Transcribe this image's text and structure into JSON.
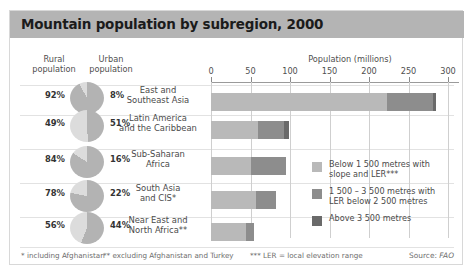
{
  "title": "Mountain population by subregion, 2000",
  "headers": {
    "rural": "Rural\npopulation",
    "rural_line1": "Rural",
    "rural_line2": "population",
    "urban_line1": "Urban",
    "urban_line2": "population",
    "population_axis": "Population (millions)"
  },
  "colors": {
    "title_bar": "#b4b4b4",
    "light": "#b9b9b9",
    "mid": "#8d8d8d",
    "dark": "#6a6a6a",
    "pie_rural": "#b3b3b3",
    "pie_urban": "#dcdcdc",
    "grid": "#cfcfcf",
    "text": "#4a4a4a"
  },
  "axis": {
    "label": "Population (millions)",
    "min": 0,
    "max": 300,
    "ticks": [
      0,
      50,
      100,
      150,
      200,
      250,
      300
    ],
    "tick_labels": [
      "0",
      "50",
      "100",
      "150",
      "200",
      "250",
      "300"
    ]
  },
  "rows": [
    {
      "region_line1": "East and",
      "region_line2": "Southeast Asia",
      "rural_pct": "92%",
      "urban_pct": "8%",
      "rural_value": 92,
      "urban_value": 8,
      "segments": [
        223,
        58,
        4
      ],
      "total": 285
    },
    {
      "region_line1": "Latin America",
      "region_line2": "and the Caribbean",
      "rural_pct": "49%",
      "urban_pct": "51%",
      "rural_value": 49,
      "urban_value": 51,
      "segments": [
        60,
        32,
        7
      ],
      "total": 99
    },
    {
      "region_line1": "Sub-Saharan",
      "region_line2": "Africa",
      "rural_pct": "84%",
      "urban_pct": "16%",
      "rural_value": 84,
      "urban_value": 16,
      "segments": [
        50,
        45,
        0
      ],
      "total": 95
    },
    {
      "region_line1": "South Asia",
      "region_line2": "and CIS*",
      "rural_pct": "78%",
      "urban_pct": "22%",
      "rural_value": 78,
      "urban_value": 22,
      "segments": [
        57,
        25,
        0
      ],
      "total": 82
    },
    {
      "region_line1": "Near East and",
      "region_line2": "North Africa**",
      "rural_pct": "56%",
      "urban_pct": "44%",
      "rural_value": 56,
      "urban_value": 44,
      "segments": [
        44,
        10,
        0
      ],
      "total": 54
    }
  ],
  "legend": [
    {
      "swatch": "#b9b9b9",
      "line1": "Below 1 500 metres with",
      "line2": "slope and LER***"
    },
    {
      "swatch": "#8d8d8d",
      "line1": "1 500 – 3 500 metres with",
      "line2": "LER below 2 500 metres"
    },
    {
      "swatch": "#6a6a6a",
      "line1": "Above 3 500 metres",
      "line2": ""
    }
  ],
  "footnotes": {
    "note1": "* including Afghanistan",
    "note2": "** excluding Afghanistan and Turkey",
    "note3": "*** LER = local elevation range",
    "source_label": "Source:",
    "source_value": "FAO"
  },
  "chart_data": {
    "type": "bar",
    "title": "Mountain population by subregion, 2000",
    "xlabel": "Population (millions)",
    "ylabel": "",
    "xlim": [
      0,
      300
    ],
    "grid": true,
    "orientation": "horizontal",
    "stacked": true,
    "legend_position": "right",
    "categories": [
      "East and Southeast Asia",
      "Latin America and the Caribbean",
      "Sub-Saharan Africa",
      "South Asia and CIS*",
      "Near East and North Africa**"
    ],
    "series": [
      {
        "name": "Below 1 500 metres with slope and LER***",
        "values": [
          223,
          60,
          50,
          57,
          44
        ]
      },
      {
        "name": "1 500 – 3 500 metres with LER below 2 500 metres",
        "values": [
          58,
          32,
          45,
          25,
          10
        ]
      },
      {
        "name": "Above 3 500 metres",
        "values": [
          4,
          7,
          0,
          0,
          0
        ]
      }
    ],
    "totals": [
      285,
      99,
      95,
      82,
      54
    ],
    "pies": {
      "type": "pie",
      "labels": [
        "Rural population",
        "Urban population"
      ],
      "data": [
        {
          "category": "East and Southeast Asia",
          "rural": 92,
          "urban": 8
        },
        {
          "category": "Latin America and the Caribbean",
          "rural": 49,
          "urban": 51
        },
        {
          "category": "Sub-Saharan Africa",
          "rural": 84,
          "urban": 16
        },
        {
          "category": "South Asia and CIS*",
          "rural": 78,
          "urban": 22
        },
        {
          "category": "Near East and North Africa**",
          "rural": 56,
          "urban": 44
        }
      ]
    },
    "annotations": [
      "* including Afghanistan",
      "** excluding Afghanistan and Turkey",
      "*** LER = local elevation range",
      "Source: FAO"
    ]
  }
}
